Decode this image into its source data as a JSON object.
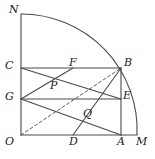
{
  "figure": {
    "kind": "geometry-diagram",
    "stroke_color": "#4a4a4a",
    "label_color": "#1a1a1a",
    "background_color": "#ffffff",
    "arc": {
      "center_label": "O",
      "radius_px": 116,
      "from_label": "N",
      "to_label": "M"
    },
    "points": [
      {
        "id": "N",
        "label": "N",
        "x": 21,
        "y": 14,
        "label_x": 9,
        "label_y": 4
      },
      {
        "id": "C",
        "label": "C",
        "x": 21,
        "y": 68,
        "label_x": 5,
        "label_y": 60
      },
      {
        "id": "F",
        "label": "F",
        "x": 73,
        "y": 68,
        "label_x": 69,
        "label_y": 57
      },
      {
        "id": "B",
        "label": "B",
        "x": 121,
        "y": 68,
        "label_x": 124,
        "label_y": 57
      },
      {
        "id": "P",
        "label": "P",
        "x": 53,
        "y": 80,
        "label_x": 50,
        "label_y": 80
      },
      {
        "id": "G",
        "label": "G",
        "x": 21,
        "y": 99,
        "label_x": 5,
        "label_y": 91
      },
      {
        "id": "E",
        "label": "E",
        "x": 121,
        "y": 99,
        "label_x": 123,
        "label_y": 90
      },
      {
        "id": "Q",
        "label": "Q",
        "x": 86,
        "y": 108,
        "label_x": 83,
        "label_y": 108
      },
      {
        "id": "O",
        "label": "O",
        "x": 21,
        "y": 135,
        "label_x": 5,
        "label_y": 136
      },
      {
        "id": "D",
        "label": "D",
        "x": 73,
        "y": 135,
        "label_x": 69,
        "label_y": 136
      },
      {
        "id": "A",
        "label": "A",
        "x": 121,
        "y": 135,
        "label_x": 117,
        "label_y": 136
      },
      {
        "id": "M",
        "label": "M",
        "x": 137,
        "y": 135,
        "label_x": 136,
        "label_y": 136
      }
    ],
    "segments": [
      {
        "name": "segment-O-N",
        "from": "O",
        "to": "N",
        "style": "solid"
      },
      {
        "name": "segment-O-M",
        "from": "O",
        "to": "M",
        "style": "solid"
      },
      {
        "name": "segment-C-B",
        "from": "C",
        "to": "B",
        "style": "solid"
      },
      {
        "name": "segment-G-E",
        "from": "G",
        "to": "E",
        "style": "solid"
      },
      {
        "name": "segment-A-B",
        "from": "A",
        "to": "B",
        "style": "solid"
      },
      {
        "name": "segment-C-E",
        "from": "C",
        "to": "E",
        "style": "solid"
      },
      {
        "name": "segment-G-F",
        "from": "G",
        "to": "F",
        "style": "solid"
      },
      {
        "name": "segment-G-A",
        "from": "G",
        "to": "A",
        "style": "solid"
      },
      {
        "name": "segment-D-B",
        "from": "D",
        "to": "B",
        "style": "solid"
      },
      {
        "name": "segment-O-B",
        "from": "O",
        "to": "B",
        "style": "dashed"
      }
    ]
  }
}
